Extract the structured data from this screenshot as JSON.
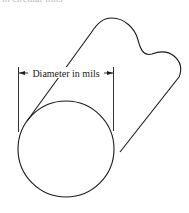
{
  "figure": {
    "top_caption_fragment": "in circular mils",
    "dimension_label": "Diameter in mils",
    "colors": {
      "stroke": "#1a1a1a",
      "text": "#222222",
      "background": "#ffffff"
    }
  }
}
